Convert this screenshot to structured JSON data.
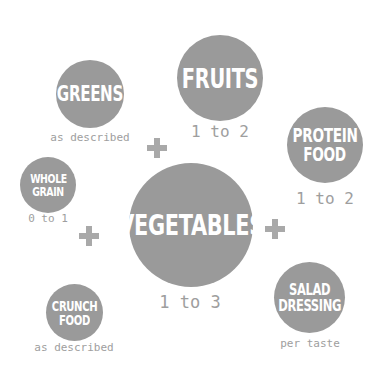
{
  "diagram": {
    "colors": {
      "circle": "#9a9a9a",
      "circle_text": "#ffffff",
      "quantity_text": "#9e9e9e",
      "plus": "#a9a9a9",
      "background": "#ffffff"
    },
    "nodes": {
      "greens": {
        "lines": [
          "GREENS"
        ],
        "quantity": "as described"
      },
      "fruits": {
        "lines": [
          "FRUITS"
        ],
        "quantity": "1 to 2"
      },
      "protein_food": {
        "lines": [
          "PROTEIN",
          "FOOD"
        ],
        "quantity": "1 to 2"
      },
      "whole_grain": {
        "lines": [
          "WHOLE",
          "GRAIN"
        ],
        "quantity": "0 to 1"
      },
      "vegetables": {
        "lines": [
          "VEGETABLES"
        ],
        "quantity": "1 to 3"
      },
      "salad_dressing": {
        "lines": [
          "SALAD",
          "DRESSING"
        ],
        "quantity": "per taste"
      },
      "crunch_food": {
        "lines": [
          "CRUNCH",
          "FOOD"
        ],
        "quantity": "as described"
      }
    },
    "connectors": [
      "plus-icon",
      "plus-icon",
      "plus-icon"
    ]
  }
}
